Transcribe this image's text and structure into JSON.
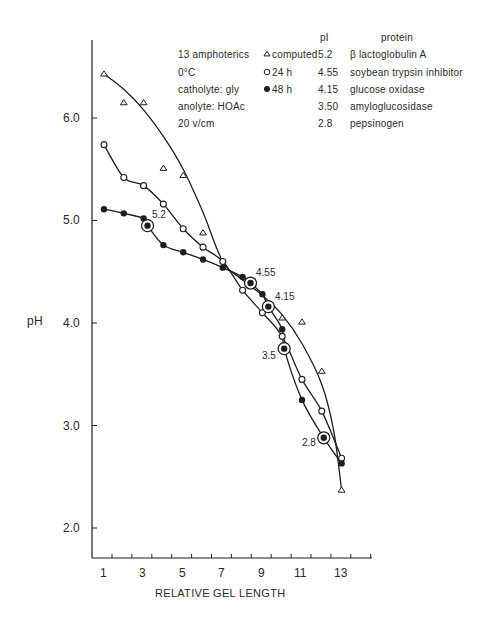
{
  "chart_data": {
    "type": "line",
    "title": "",
    "xlabel": "RELATIVE GEL LENGTH",
    "ylabel": "pH",
    "xlim": [
      0.6,
      14.5
    ],
    "ylim": [
      1.7,
      6.7
    ],
    "x_ticks": [
      1,
      3,
      5,
      7,
      9,
      11,
      13
    ],
    "y_ticks": [
      "2.0",
      "3.0",
      "4.0",
      "5.0",
      "6.0"
    ],
    "grid": false,
    "legend_position": "top-right (inside)",
    "conditions": [
      "13 amphoterics",
      "0°C",
      "catholyte: gly",
      "anolyte: HOAc",
      "20 v/cm"
    ],
    "series": [
      {
        "name": "computed",
        "marker": "open-triangle",
        "x": [
          1,
          2,
          3,
          4,
          5,
          6,
          10,
          11,
          12,
          13
        ],
        "y": [
          6.43,
          6.15,
          6.15,
          5.51,
          5.44,
          4.88,
          4.05,
          4.01,
          3.53,
          2.37
        ],
        "curve_x": [
          1,
          2,
          3,
          4,
          5,
          6,
          7,
          8,
          9,
          10,
          11,
          12,
          12.6,
          13
        ],
        "curve_y": [
          6.43,
          6.28,
          6.08,
          5.82,
          5.5,
          5.08,
          4.6,
          4.42,
          4.27,
          4.08,
          3.8,
          3.4,
          2.95,
          2.37
        ]
      },
      {
        "name": "24 h",
        "marker": "open-circle",
        "x": [
          1,
          2,
          3,
          4,
          5,
          6,
          7,
          8,
          9,
          10,
          11,
          12,
          13
        ],
        "y": [
          5.74,
          5.42,
          5.34,
          5.16,
          4.92,
          4.74,
          4.6,
          4.32,
          4.1,
          3.87,
          3.45,
          3.14,
          2.68
        ]
      },
      {
        "name": "48 h",
        "marker": "filled-circle",
        "x": [
          1,
          2,
          3,
          4,
          5,
          6,
          7,
          8,
          9,
          10,
          11,
          13
        ],
        "y": [
          5.11,
          5.07,
          5.02,
          4.76,
          4.69,
          4.62,
          4.54,
          4.45,
          4.28,
          3.94,
          3.25,
          2.63
        ]
      }
    ],
    "marker_proteins": {
      "header_pI": "pI",
      "header_protein": "protein",
      "rows": [
        {
          "pI": "5.2",
          "protein": "β lactoglobulin A",
          "x": 3.2,
          "y": 4.95,
          "label": "5.2"
        },
        {
          "pI": "4.55",
          "protein": "soybean trypsin inhibitor",
          "x": 8.4,
          "y": 4.39,
          "label": "4.55"
        },
        {
          "pI": "4.15",
          "protein": "glucose oxidase",
          "x": 9.3,
          "y": 4.16,
          "label": "4.15"
        },
        {
          "pI": "3.50",
          "protein": "amyloglucosidase",
          "x": 10.1,
          "y": 3.75,
          "label": "3.5"
        },
        {
          "pI": "2.8",
          "protein": "pepsinogen",
          "x": 12.1,
          "y": 2.88,
          "label": "2.8"
        }
      ]
    }
  },
  "legend": {
    "conditions": [
      "13 amphoterics",
      "0°C",
      "catholyte: gly",
      "anolyte: HOAc",
      "20 v/cm"
    ],
    "series_labels": [
      "computed",
      "24 h",
      "48 h"
    ],
    "pI_header": "pI",
    "protein_header": "protein",
    "pI_values": [
      "5.2",
      "4.55",
      "4.15",
      "3.50",
      "2.8"
    ],
    "proteins": [
      "β lactoglobulin A",
      "soybean trypsin inhibitor",
      "glucose oxidase",
      "amyloglucosidase",
      "pepsinogen"
    ]
  },
  "axes": {
    "xlabel": "RELATIVE GEL LENGTH",
    "ylabel": "pH",
    "x_tick_labels": [
      "1",
      "3",
      "5",
      "7",
      "9",
      "11",
      "13"
    ],
    "y_tick_labels": [
      "6.0",
      "5.0",
      "4.0",
      "3.0",
      "2.0"
    ]
  },
  "style": {
    "ink": "#1e1e1e",
    "background": "#ffffff"
  }
}
